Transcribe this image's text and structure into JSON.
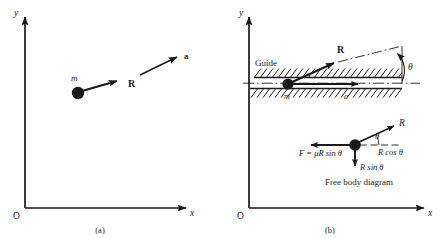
{
  "figure": {
    "background_color": "#ffffff",
    "ink_color": "#1a1a1a",
    "panels": [
      {
        "id": "a",
        "caption": "(a)",
        "axes": {
          "origin_label": "O",
          "x_label": "x",
          "y_label": "y"
        },
        "labels": {
          "mass": "m",
          "force": "R",
          "acceleration": "a"
        }
      },
      {
        "id": "b",
        "caption": "(b)",
        "axes": {
          "origin_label": "O",
          "x_label": "x",
          "y_label": "y"
        },
        "labels": {
          "guide": "Guide",
          "mass": "m",
          "acceleration": "a",
          "force": "R",
          "angle": "θ"
        },
        "free_body": {
          "title": "Free body diagram",
          "force_normal": "R",
          "angle": "θ",
          "friction": "F = μR sin θ",
          "horizontal_component": "R cos θ",
          "vertical_component": "R sin θ"
        }
      }
    ]
  }
}
